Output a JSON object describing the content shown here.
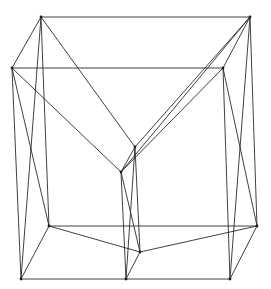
{
  "diagram": {
    "title": "",
    "line_color": "#2a2a2a",
    "background_color": "#ffffff",
    "vertices": [
      "A",
      "B",
      "C",
      "D",
      "E",
      "F",
      "G",
      "H",
      "I",
      "J",
      "K",
      "L"
    ],
    "edges": [
      [
        "A",
        "B"
      ],
      [
        "C",
        "D"
      ],
      [
        "A",
        "C"
      ],
      [
        "B",
        "D"
      ],
      [
        "A",
        "E"
      ],
      [
        "C",
        "F"
      ],
      [
        "B",
        "E"
      ],
      [
        "D",
        "F"
      ],
      [
        "B",
        "F"
      ],
      [
        "E",
        "F"
      ],
      [
        "A",
        "G"
      ],
      [
        "C",
        "I"
      ],
      [
        "A",
        "I"
      ],
      [
        "C",
        "G"
      ],
      [
        "B",
        "H"
      ],
      [
        "D",
        "K"
      ],
      [
        "B",
        "K"
      ],
      [
        "D",
        "H"
      ],
      [
        "E",
        "L"
      ],
      [
        "F",
        "J"
      ],
      [
        "E",
        "J"
      ],
      [
        "F",
        "L"
      ],
      [
        "G",
        "H"
      ],
      [
        "I",
        "J"
      ],
      [
        "J",
        "K"
      ],
      [
        "G",
        "I"
      ],
      [
        "H",
        "K"
      ],
      [
        "G",
        "L"
      ],
      [
        "L",
        "H"
      ],
      [
        "L",
        "J"
      ]
    ]
  }
}
